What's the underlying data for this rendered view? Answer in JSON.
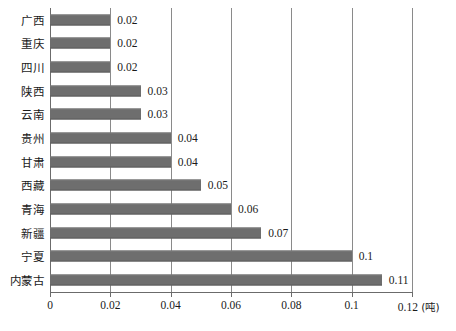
{
  "chart_data": {
    "type": "bar",
    "orientation": "horizontal",
    "title": "",
    "xlabel": "",
    "ylabel": "",
    "unit_label": "(吨)",
    "xlim": [
      0,
      0.12
    ],
    "xticks": [
      0,
      0.02,
      0.04,
      0.06,
      0.08,
      0.1,
      0.12
    ],
    "xtick_labels": [
      "0",
      "0.02",
      "0.04",
      "0.06",
      "0.08",
      "0.1",
      "0.12"
    ],
    "grid": "vertical",
    "legend": "none",
    "bar_color": "#6e6e6e",
    "categories": [
      "广西",
      "重庆",
      "四川",
      "陕西",
      "云南",
      "贵州",
      "甘肃",
      "西藏",
      "青海",
      "新疆",
      "宁夏",
      "内蒙古"
    ],
    "values": [
      0.02,
      0.02,
      0.02,
      0.03,
      0.03,
      0.04,
      0.04,
      0.05,
      0.06,
      0.07,
      0.1,
      0.11
    ],
    "data_labels": [
      "0.02",
      "0.02",
      "0.02",
      "0.03",
      "0.03",
      "0.04",
      "0.04",
      "0.05",
      "0.06",
      "0.07",
      "0.1",
      "0.11"
    ]
  }
}
